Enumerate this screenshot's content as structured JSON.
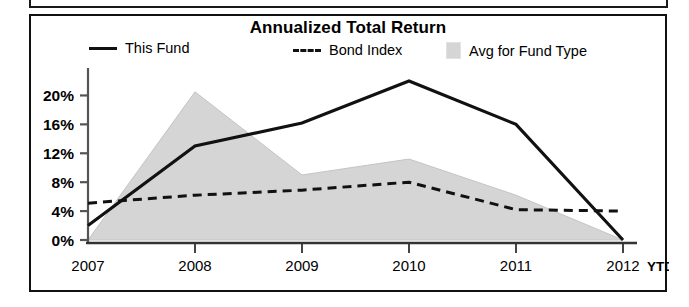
{
  "panel": {
    "title": "Annualized Total Return"
  },
  "legend": {
    "items": [
      {
        "label": "This Fund",
        "marker": "solid-line-swatch"
      },
      {
        "label": "Bond Index",
        "marker": "dashed-line-swatch"
      },
      {
        "label": "Avg for Fund Type",
        "marker": "area-fill-swatch"
      }
    ]
  },
  "axes": {
    "y_ticks": [
      "0%",
      "4%",
      "8%",
      "12%",
      "16%",
      "20%"
    ],
    "x_ticks": [
      "2007",
      "2008",
      "2009",
      "2010",
      "2011",
      "2012"
    ],
    "x_suffix": "YTD"
  },
  "colors": {
    "line": "#111111",
    "area_fill": "#d5d5d5",
    "area_edge": "#bdbdbd",
    "axis": "#555555",
    "border": "#111111"
  },
  "chart_data": {
    "type": "line",
    "title": "Annualized Total Return",
    "xlabel": "",
    "ylabel": "",
    "categories": [
      "2007",
      "2008",
      "2009",
      "2010",
      "2011",
      "2012 YTD"
    ],
    "ylim": [
      0,
      22
    ],
    "yticks": [
      0,
      4,
      8,
      12,
      16,
      20
    ],
    "ytick_labels": [
      "0%",
      "4%",
      "8%",
      "12%",
      "16%",
      "20%"
    ],
    "grid": false,
    "legend_position": "top",
    "series": [
      {
        "name": "This Fund",
        "style": "solid",
        "values": [
          2.0,
          13.0,
          16.2,
          22.0,
          16.0,
          0.0
        ]
      },
      {
        "name": "Bond Index",
        "style": "dashed",
        "values": [
          5.1,
          6.2,
          6.9,
          8.0,
          4.2,
          4.0
        ]
      },
      {
        "name": "Avg for Fund Type",
        "style": "area",
        "values": [
          0.0,
          20.5,
          9.0,
          11.2,
          6.2,
          0.0
        ]
      }
    ]
  }
}
